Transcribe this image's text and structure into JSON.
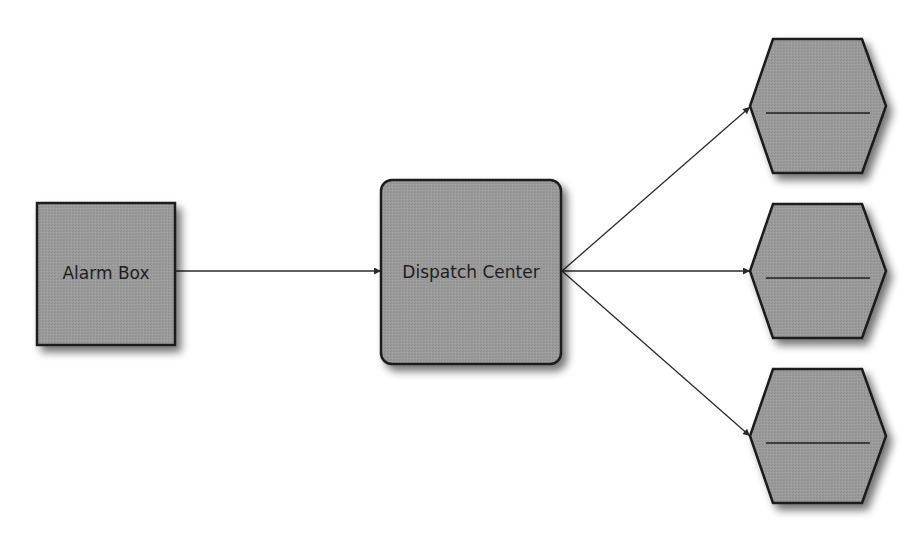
{
  "diagram": {
    "type": "flow",
    "colors": {
      "background": "#ffffff",
      "node_fill": "#9a9a9a",
      "node_stroke": "#1a1a1a",
      "edge": "#2a2a2a",
      "shadow": "#6e6e6e"
    },
    "nodes": [
      {
        "id": "alarm_box",
        "label": "Alarm Box",
        "shape": "square"
      },
      {
        "id": "dispatch_center",
        "label": "Dispatch Center",
        "shape": "rounded-square"
      },
      {
        "id": "unit_1",
        "label": "",
        "shape": "hexagon"
      },
      {
        "id": "unit_2",
        "label": "",
        "shape": "hexagon"
      },
      {
        "id": "unit_3",
        "label": "",
        "shape": "hexagon"
      }
    ],
    "edges": [
      {
        "from": "alarm_box",
        "to": "dispatch_center"
      },
      {
        "from": "dispatch_center",
        "to": "unit_1"
      },
      {
        "from": "dispatch_center",
        "to": "unit_2"
      },
      {
        "from": "dispatch_center",
        "to": "unit_3"
      }
    ]
  }
}
